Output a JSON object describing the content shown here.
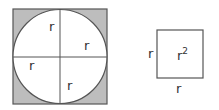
{
  "diagram": {
    "circle_in_square": {
      "labels": [
        "r",
        "r",
        "r",
        "r"
      ],
      "colors": {
        "fill_corner": "#bdbdbd",
        "circle_fill": "#ffffff",
        "stroke": "#555555"
      }
    },
    "square": {
      "side_left_label": "r",
      "side_bottom_label": "r",
      "area_label_base": "r",
      "area_label_exp": "2"
    }
  }
}
